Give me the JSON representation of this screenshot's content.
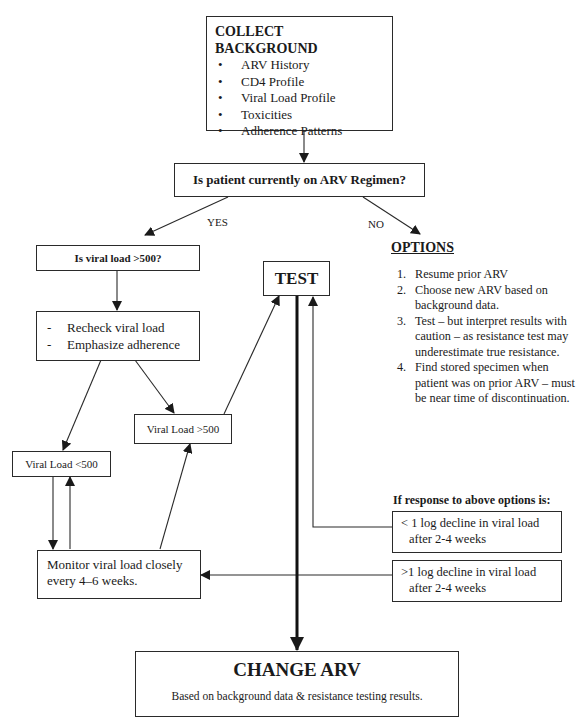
{
  "collect_background": {
    "title": "COLLECT BACKGROUND",
    "items": [
      "ARV History",
      "CD4 Profile",
      "Viral Load Profile",
      "Toxicities",
      "Adherence Patterns"
    ]
  },
  "question_regimen": "Is patient currently on ARV Regimen?",
  "branch_labels": {
    "yes": "YES",
    "no": "NO"
  },
  "question_viral_load": "Is viral load >500?",
  "recheck": {
    "items": [
      "Recheck viral load",
      "Emphasize adherence"
    ],
    "bullet": "-"
  },
  "viral_load_high": "Viral Load >500",
  "viral_load_low": "Viral Load <500",
  "monitor": {
    "line1": "Monitor viral load closely",
    "line2": "every 4–6 weeks."
  },
  "test": "TEST",
  "options": {
    "title": "OPTIONS",
    "items": [
      {
        "num": "1.",
        "text": "Resume prior ARV"
      },
      {
        "num": "2.",
        "text": "Choose new ARV based on background data."
      },
      {
        "num": "3.",
        "text": "Test – but interpret results with caution – as resistance test may underestimate true resistance."
      },
      {
        "num": "4.",
        "text": "Find stored specimen when patient was on prior ARV – must be near time of discontinuation."
      }
    ]
  },
  "response": {
    "title": "If response to above options is:",
    "less_decline": {
      "line1": "< 1 log decline in viral load",
      "line2": "after 2-4 weeks"
    },
    "more_decline": {
      "line1": ">1 log decline in viral load",
      "line2": "after 2-4 weeks"
    }
  },
  "change_arv": {
    "title": "CHANGE ARV",
    "subtitle": "Based on background data & resistance testing results."
  }
}
